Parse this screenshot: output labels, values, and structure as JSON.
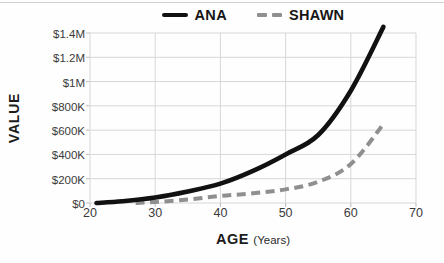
{
  "colors": {
    "ana_line": "#111111",
    "shawn_line": "#8f8f8f",
    "grid": "#d7d7d7",
    "tick_text": "#3a3a3a",
    "title_text": "#1c1c1c"
  },
  "legend": {
    "items": [
      {
        "label": "ANA",
        "swatch": "solid-black-line"
      },
      {
        "label": "SHAWN",
        "swatch": "dashed-gray-line"
      }
    ]
  },
  "chart_data": {
    "type": "line",
    "title": "",
    "ylabel": "VALUE",
    "xlabel_main": "AGE",
    "xlabel_units": "(Years)",
    "legend_position": "top-center",
    "grid": true,
    "xlim": [
      20,
      70
    ],
    "ylim_thousands_usd": [
      0,
      1400
    ],
    "x_tick_labels": [
      "20",
      "30",
      "40",
      "50",
      "60",
      "70"
    ],
    "x_tick_values": [
      20,
      30,
      40,
      50,
      60,
      70
    ],
    "y_tick_labels": [
      "$0",
      "$200K",
      "$400K",
      "$600K",
      "$800K",
      "$1M",
      "$1.2M",
      "$1.4M"
    ],
    "y_tick_values_thousands": [
      0,
      200,
      400,
      600,
      800,
      1000,
      1200,
      1400
    ],
    "series": [
      {
        "name": "ANA",
        "style": "solid",
        "color": "#111111",
        "points_age_vs_thousands_usd": [
          [
            21,
            0
          ],
          [
            25,
            15
          ],
          [
            30,
            45
          ],
          [
            35,
            95
          ],
          [
            40,
            160
          ],
          [
            45,
            265
          ],
          [
            50,
            400
          ],
          [
            55,
            560
          ],
          [
            60,
            925
          ],
          [
            65,
            1450
          ]
        ]
      },
      {
        "name": "SHAWN",
        "style": "dashed",
        "color": "#8f8f8f",
        "points_age_vs_thousands_usd": [
          [
            27,
            0
          ],
          [
            30,
            8
          ],
          [
            35,
            28
          ],
          [
            40,
            58
          ],
          [
            45,
            80
          ],
          [
            50,
            112
          ],
          [
            55,
            175
          ],
          [
            60,
            320
          ],
          [
            65,
            650
          ]
        ]
      }
    ]
  }
}
